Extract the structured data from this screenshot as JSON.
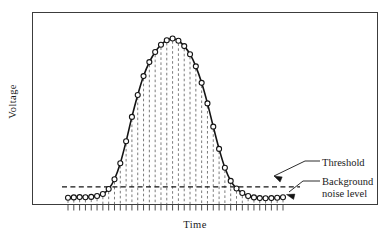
{
  "chart_data": {
    "type": "line",
    "title": "",
    "subtitle": "",
    "xlabel": "Time",
    "ylabel": "Voltage",
    "grid": false,
    "legend": "none",
    "axis_ticks_labeled": false,
    "marker": "open-circle",
    "line_style": "solid",
    "dropline_style": "dashed",
    "xlim": [
      0,
      37
    ],
    "ylim": [
      0,
      1
    ],
    "baseline_level": 0.045,
    "threshold_level": 0.105,
    "x": [
      0,
      1,
      2,
      3,
      4,
      5,
      6,
      7,
      8,
      9,
      10,
      11,
      12,
      13,
      14,
      15,
      16,
      17,
      18,
      19,
      20,
      21,
      22,
      23,
      24,
      25,
      26,
      27,
      28,
      29,
      30,
      31,
      32,
      33,
      34,
      35,
      36,
      37
    ],
    "values": [
      0.04,
      0.042,
      0.044,
      0.043,
      0.045,
      0.05,
      0.062,
      0.092,
      0.15,
      0.245,
      0.375,
      0.52,
      0.65,
      0.762,
      0.845,
      0.905,
      0.948,
      0.975,
      0.985,
      0.972,
      0.94,
      0.892,
      0.82,
      0.722,
      0.6,
      0.462,
      0.33,
      0.218,
      0.14,
      0.095,
      0.068,
      0.05,
      0.042,
      0.038,
      0.037,
      0.038,
      0.04,
      0.043
    ],
    "annotations": [
      {
        "id": "threshold",
        "label": "Threshold",
        "points_to": "threshold-line"
      },
      {
        "id": "background",
        "label": "Background",
        "label2": "noise  level",
        "points_to": "baseline-points"
      }
    ],
    "colors": {
      "curve": "#141414",
      "marker_fill": "#ffffff",
      "marker_stroke": "#141414",
      "dropline": "#5a5a5a",
      "threshold_line": "#141414",
      "frame": "#3c3c3c",
      "axis": "#3c3c3c",
      "text": "#1a1a1a",
      "background": "#ffffff"
    }
  },
  "annotations": {
    "threshold_label": "Threshold",
    "background_label": "Background",
    "noise_level_label": "noise  level"
  },
  "axes": {
    "ylabel": "Voltage",
    "xlabel": "Time"
  }
}
